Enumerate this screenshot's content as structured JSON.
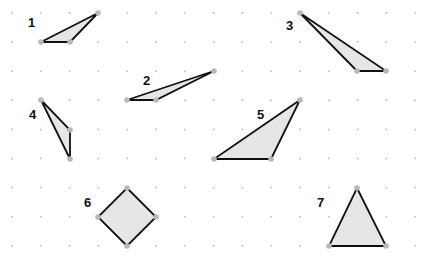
{
  "grid": {
    "origin_x": 12,
    "origin_y": 13,
    "step_x": 28.8,
    "step_y": 29.1,
    "cols": 15,
    "rows": 9,
    "dot_color": "#c4c4c4"
  },
  "style": {
    "fill": "#e6e6e6",
    "stroke": "#111111",
    "vertex_color": "#b8b8b8"
  },
  "shapes": [
    {
      "label": "1",
      "label_pos": [
        28,
        27
      ],
      "points": [
        [
          41,
          42
        ],
        [
          70,
          42
        ],
        [
          98,
          13
        ]
      ]
    },
    {
      "label": "2",
      "label_pos": [
        143,
        85
      ],
      "points": [
        [
          127,
          100
        ],
        [
          156,
          100
        ],
        [
          214,
          71
        ]
      ]
    },
    {
      "label": "3",
      "label_pos": [
        286,
        30
      ],
      "points": [
        [
          300,
          13
        ],
        [
          357,
          71
        ],
        [
          386,
          71
        ]
      ]
    },
    {
      "label": "4",
      "label_pos": [
        29,
        119
      ],
      "points": [
        [
          41,
          100
        ],
        [
          70,
          130
        ],
        [
          70,
          159
        ]
      ]
    },
    {
      "label": "5",
      "label_pos": [
        257,
        119
      ],
      "points": [
        [
          214,
          159
        ],
        [
          271,
          159
        ],
        [
          300,
          100
        ]
      ]
    },
    {
      "label": "6",
      "label_pos": [
        84,
        207
      ],
      "points": [
        [
          127,
          188
        ],
        [
          156,
          217
        ],
        [
          127,
          246
        ],
        [
          98,
          217
        ]
      ]
    },
    {
      "label": "7",
      "label_pos": [
        317,
        207
      ],
      "points": [
        [
          357,
          188
        ],
        [
          386,
          246
        ],
        [
          329,
          246
        ]
      ]
    }
  ]
}
